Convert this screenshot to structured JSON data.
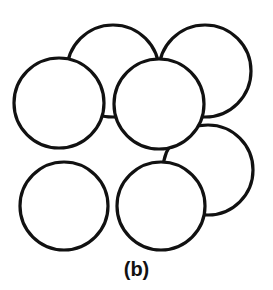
{
  "figure": {
    "caption": "(b)",
    "background_color": "#ffffff",
    "stroke_color": "#111111",
    "fill_color": "#ffffff",
    "stroke_width": 3.2,
    "canvas": {
      "width": 273,
      "height": 290
    }
  },
  "diagram_data": {
    "type": "diagram",
    "subtype": "packed-circles",
    "description": "Seven overlapping outlined circles representing close-packed atomic spheres viewed along a crystal axis",
    "units": "px",
    "circle_count": 7,
    "circles": [
      {
        "name": "top-center-sphere",
        "cx": 113,
        "cy": 71,
        "r": 46,
        "z": 1
      },
      {
        "name": "top-right-sphere",
        "cx": 205,
        "cy": 71,
        "r": 46,
        "z": 2
      },
      {
        "name": "middle-right-sphere",
        "cx": 208,
        "cy": 170,
        "r": 45,
        "z": 3
      },
      {
        "name": "middle-left-sphere",
        "cx": 59,
        "cy": 103,
        "r": 45,
        "z": 4
      },
      {
        "name": "center-sphere",
        "cx": 159,
        "cy": 104,
        "r": 45,
        "z": 5
      },
      {
        "name": "bottom-left-sphere",
        "cx": 64,
        "cy": 206,
        "r": 44,
        "z": 6
      },
      {
        "name": "bottom-center-sphere",
        "cx": 161,
        "cy": 206,
        "r": 44,
        "z": 7
      }
    ]
  }
}
